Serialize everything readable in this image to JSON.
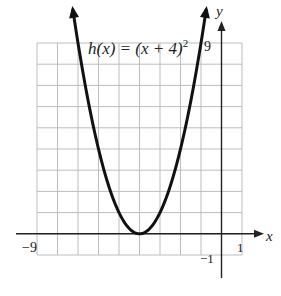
{
  "chart_data": {
    "type": "line",
    "function": "h(x) = (x + 4)^2",
    "xlabel": "x",
    "ylabel": "y",
    "xlim": [
      -9,
      1
    ],
    "ylim": [
      -1,
      9
    ],
    "grid": true,
    "tick_labels": {
      "x": [
        "-9",
        "-1",
        "1"
      ],
      "y": [
        "9"
      ]
    },
    "series": [
      {
        "name": "h(x) = (x + 4)^2",
        "x": [
          -7.3,
          -7,
          -6,
          -5,
          -4,
          -3,
          -2,
          -1,
          -0.7
        ],
        "y": [
          10.9,
          9,
          4,
          1,
          0,
          1,
          4,
          9,
          10.9
        ]
      }
    ],
    "vertex": [
      -4,
      0
    ],
    "annotations": [
      "arrows at both ends of curve indicate it continues upward"
    ]
  },
  "labels": {
    "function": "h(x) = (x + 4)",
    "exponent": "2",
    "x_axis": "x",
    "y_axis": "y",
    "x_min": "−9",
    "x_neg1": "−1",
    "x_max": "1",
    "y_max": "9"
  }
}
